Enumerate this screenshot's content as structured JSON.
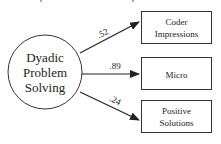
{
  "diagram": {
    "latent": {
      "lines": [
        "Dyadic",
        "Problem",
        "Solving"
      ]
    },
    "indicators": [
      {
        "lines": [
          "Coder",
          "Impressions"
        ],
        "loading": ".52"
      },
      {
        "lines": [
          "Micro"
        ],
        "loading": ".89"
      },
      {
        "lines": [
          "Positive",
          "Solutions"
        ],
        "loading": ".24"
      }
    ],
    "colors": {
      "stroke": "#222222",
      "background": "#ffffff"
    }
  }
}
